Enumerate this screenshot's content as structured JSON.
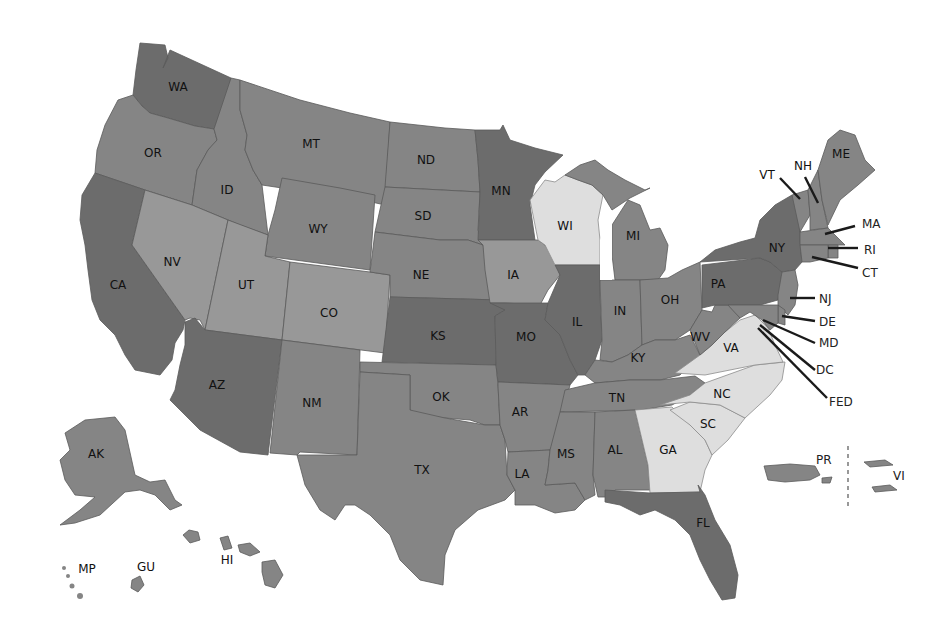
{
  "map": {
    "type": "choropleth",
    "region": "United States and territories",
    "shade_colors": {
      "darkest": "#6c6c6c",
      "medium": "#858585",
      "light_medium": "#989898",
      "light": "#dedede"
    },
    "labels": {
      "WA": "WA",
      "OR": "OR",
      "CA": "CA",
      "ID": "ID",
      "NV": "NV",
      "MT": "MT",
      "WY": "WY",
      "UT": "UT",
      "AZ": "AZ",
      "CO": "CO",
      "NM": "NM",
      "ND": "ND",
      "SD": "SD",
      "NE": "NE",
      "KS": "KS",
      "OK": "OK",
      "TX": "TX",
      "MN": "MN",
      "IA": "IA",
      "MO": "MO",
      "AR": "AR",
      "LA": "LA",
      "WI": "WI",
      "IL": "IL",
      "MI": "MI",
      "IN": "IN",
      "OH": "OH",
      "KY": "KY",
      "TN": "TN",
      "MS": "MS",
      "AL": "AL",
      "GA": "GA",
      "FL": "FL",
      "SC": "SC",
      "NC": "NC",
      "VA": "VA",
      "WV": "WV",
      "PA": "PA",
      "NY": "NY",
      "ME": "ME",
      "VT": "VT",
      "NH": "NH",
      "MA": "MA",
      "RI": "RI",
      "CT": "CT",
      "NJ": "NJ",
      "DE": "DE",
      "MD": "MD",
      "DC": "DC",
      "FED": "FED",
      "AK": "AK",
      "HI": "HI",
      "MP": "MP",
      "GU": "GU",
      "PR": "PR",
      "VI": "VI"
    },
    "shading": {
      "darkest": [
        "WA",
        "CA",
        "AZ",
        "MN",
        "KS",
        "MO",
        "IL",
        "NY",
        "PA",
        "FL"
      ],
      "light": [
        "WI",
        "VA",
        "NC",
        "SC",
        "GA"
      ],
      "light_medium": [
        "NV",
        "UT",
        "CO",
        "IA"
      ],
      "medium": [
        "OR",
        "ID",
        "MT",
        "WY",
        "ND",
        "SD",
        "NE",
        "OK",
        "TX",
        "NM",
        "AR",
        "LA",
        "MI",
        "IN",
        "OH",
        "KY",
        "WV",
        "TN",
        "MS",
        "AL",
        "ME",
        "VT",
        "NH",
        "MA",
        "RI",
        "CT",
        "NJ",
        "DE",
        "MD",
        "DC",
        "AK",
        "HI",
        "MP",
        "GU",
        "PR",
        "VI"
      ]
    }
  }
}
